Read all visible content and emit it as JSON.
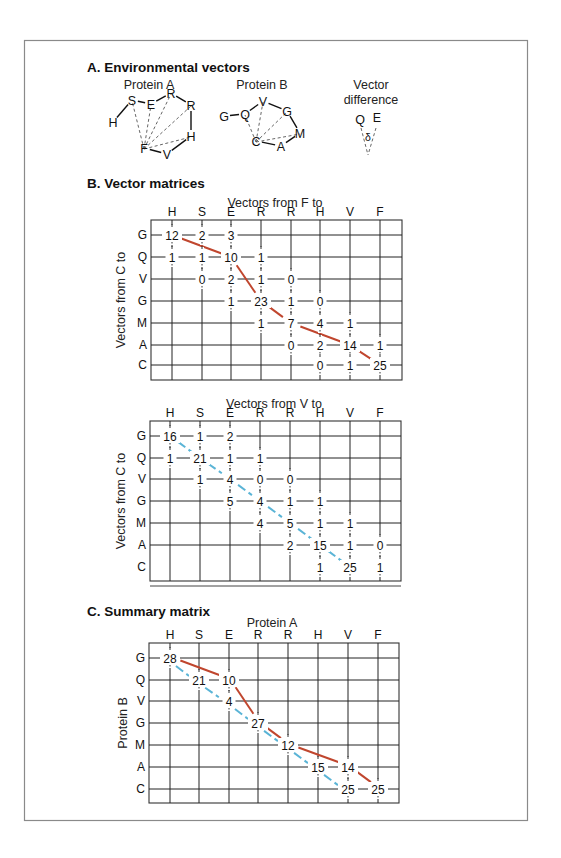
{
  "figure": {
    "section_a": {
      "title": "A. Environmental vectors",
      "protein_a": {
        "label": "Protein A",
        "nodes": [
          {
            "id": "H1",
            "label": "H",
            "x": 113,
            "y": 126
          },
          {
            "id": "S",
            "label": "S",
            "x": 132,
            "y": 104
          },
          {
            "id": "E",
            "label": "E",
            "x": 151,
            "y": 108
          },
          {
            "id": "R1",
            "label": "R",
            "x": 171,
            "y": 97
          },
          {
            "id": "R2",
            "label": "R",
            "x": 191,
            "y": 109
          },
          {
            "id": "H2",
            "label": "H",
            "x": 191,
            "y": 140
          },
          {
            "id": "V",
            "label": "V",
            "x": 167,
            "y": 158
          },
          {
            "id": "F",
            "label": "F",
            "x": 144,
            "y": 152
          }
        ],
        "center": "F"
      },
      "protein_b": {
        "label": "Protein B",
        "nodes": [
          {
            "id": "G1",
            "label": "G",
            "x": 224,
            "y": 120
          },
          {
            "id": "Q",
            "label": "Q",
            "x": 245,
            "y": 118
          },
          {
            "id": "V",
            "label": "V",
            "x": 263,
            "y": 105
          },
          {
            "id": "G2",
            "label": "G",
            "x": 287,
            "y": 115
          },
          {
            "id": "M",
            "label": "M",
            "x": 300,
            "y": 137
          },
          {
            "id": "A",
            "label": "A",
            "x": 281,
            "y": 150
          },
          {
            "id": "C",
            "label": "C",
            "x": 256,
            "y": 145
          }
        ],
        "center": "C"
      },
      "vector_difference": {
        "label_line1": "Vector",
        "label_line2": "difference",
        "left": "Q",
        "right": "E",
        "angle": "δ"
      }
    },
    "section_b": {
      "title": "B. Vector matrices",
      "matrix_f": {
        "title": "Vectors from F to",
        "row_axis": "Vectors from C to",
        "columns": [
          "H",
          "S",
          "E",
          "R",
          "R",
          "H",
          "V",
          "F"
        ],
        "rows": [
          "G",
          "Q",
          "V",
          "G",
          "M",
          "A",
          "C"
        ],
        "cells": [
          [
            12,
            2,
            3,
            null,
            null,
            null,
            null,
            null
          ],
          [
            1,
            1,
            10,
            1,
            null,
            null,
            null,
            null
          ],
          [
            null,
            0,
            2,
            1,
            0,
            null,
            null,
            null
          ],
          [
            null,
            null,
            1,
            23,
            1,
            0,
            null,
            null
          ],
          [
            null,
            null,
            null,
            1,
            7,
            4,
            1,
            null
          ],
          [
            null,
            null,
            null,
            null,
            0,
            2,
            14,
            1
          ],
          [
            null,
            null,
            null,
            null,
            null,
            0,
            1,
            25
          ]
        ],
        "path": [
          [
            0,
            0
          ],
          [
            1,
            2
          ],
          [
            3,
            3
          ],
          [
            4,
            4
          ],
          [
            5,
            6
          ],
          [
            6,
            7
          ]
        ],
        "path_color": "#c0462e"
      },
      "matrix_v": {
        "title": "Vectors from V to",
        "row_axis": "Vectors from C to",
        "columns": [
          "H",
          "S",
          "E",
          "R",
          "R",
          "H",
          "V",
          "F"
        ],
        "rows": [
          "G",
          "Q",
          "V",
          "G",
          "M",
          "A",
          "C"
        ],
        "cells": [
          [
            16,
            1,
            2,
            null,
            null,
            null,
            null,
            null
          ],
          [
            1,
            21,
            1,
            1,
            null,
            null,
            null,
            null
          ],
          [
            null,
            1,
            4,
            0,
            0,
            null,
            null,
            null
          ],
          [
            null,
            null,
            5,
            4,
            1,
            1,
            null,
            null
          ],
          [
            null,
            null,
            null,
            4,
            5,
            1,
            1,
            null
          ],
          [
            null,
            null,
            null,
            null,
            2,
            15,
            1,
            0
          ],
          [
            null,
            null,
            null,
            null,
            null,
            1,
            25,
            1
          ]
        ],
        "path": [
          [
            0,
            0
          ],
          [
            1,
            1
          ],
          [
            2,
            2
          ],
          [
            3,
            3
          ],
          [
            4,
            4
          ],
          [
            5,
            5
          ],
          [
            6,
            6
          ]
        ],
        "path_color": "#5ab4d6"
      }
    },
    "section_c": {
      "title": "C. Summary matrix",
      "col_axis": "Protein A",
      "row_axis": "Protein B",
      "columns": [
        "H",
        "S",
        "E",
        "R",
        "R",
        "H",
        "V",
        "F"
      ],
      "rows": [
        "G",
        "Q",
        "V",
        "G",
        "M",
        "A",
        "C"
      ],
      "cells": [
        [
          28,
          null,
          null,
          null,
          null,
          null,
          null,
          null
        ],
        [
          null,
          21,
          10,
          null,
          null,
          null,
          null,
          null
        ],
        [
          null,
          null,
          4,
          null,
          null,
          null,
          null,
          null
        ],
        [
          null,
          null,
          null,
          27,
          null,
          null,
          null,
          null
        ],
        [
          null,
          null,
          null,
          null,
          12,
          null,
          null,
          null
        ],
        [
          null,
          null,
          null,
          null,
          null,
          15,
          14,
          null
        ],
        [
          null,
          null,
          null,
          null,
          null,
          null,
          25,
          25
        ]
      ],
      "red_path": [
        [
          0,
          0
        ],
        [
          1,
          2
        ],
        [
          3,
          3
        ],
        [
          4,
          4
        ],
        [
          5,
          6
        ],
        [
          6,
          7
        ]
      ],
      "blue_path": [
        [
          0,
          0
        ],
        [
          1,
          1
        ],
        [
          2,
          2
        ],
        [
          3,
          3
        ],
        [
          4,
          4
        ],
        [
          5,
          5
        ],
        [
          6,
          6
        ]
      ],
      "red_color": "#c0462e",
      "blue_color": "#5ab4d6"
    }
  }
}
